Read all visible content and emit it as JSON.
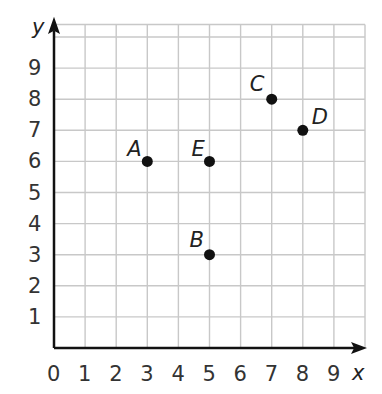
{
  "chart_data": {
    "type": "scatter",
    "title": "",
    "xlabel": "x",
    "ylabel": "y",
    "xlim": [
      0,
      10
    ],
    "ylim": [
      0,
      10
    ],
    "grid": true,
    "x_ticks": [
      "0",
      "1",
      "2",
      "3",
      "4",
      "5",
      "6",
      "7",
      "8",
      "9"
    ],
    "y_ticks": [
      "1",
      "2",
      "3",
      "4",
      "5",
      "6",
      "7",
      "8",
      "9"
    ],
    "points": [
      {
        "label": "A",
        "x": 3,
        "y": 6
      },
      {
        "label": "B",
        "x": 5,
        "y": 3
      },
      {
        "label": "C",
        "x": 7,
        "y": 8
      },
      {
        "label": "D",
        "x": 8,
        "y": 7
      },
      {
        "label": "E",
        "x": 5,
        "y": 6
      }
    ]
  },
  "colors": {
    "grid": "#c8c8c8",
    "axis": "#111111",
    "point": "#111111"
  }
}
